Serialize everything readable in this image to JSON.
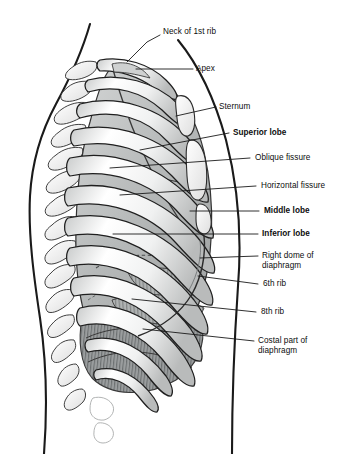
{
  "figure": {
    "background_color": "#ffffff",
    "outline_color": "#1a1a1a",
    "bone_color": "#f2f2f0",
    "lung_color": "#b9bcbd",
    "muscle_color": "#9a9c9d",
    "label_color": "#0d0d0d"
  },
  "labels": [
    {
      "id": "neck-of-1st-rib",
      "text": "Neck of 1st rib",
      "bold": false,
      "x": 163,
      "y": 27,
      "leader": [
        [
          160,
          35
        ],
        [
          147,
          42
        ],
        [
          127,
          62
        ]
      ]
    },
    {
      "id": "apex",
      "text": "Apex",
      "bold": false,
      "x": 196,
      "y": 64,
      "leader": [
        [
          193,
          69
        ],
        [
          136,
          69
        ]
      ]
    },
    {
      "id": "sternum",
      "text": "Sternum",
      "bold": false,
      "x": 219,
      "y": 102,
      "leader": [
        [
          216,
          107
        ],
        [
          176,
          116
        ]
      ]
    },
    {
      "id": "superior-lobe",
      "text": "Superior lobe",
      "bold": true,
      "x": 233,
      "y": 128,
      "leader": [
        [
          229,
          133
        ],
        [
          140,
          150
        ]
      ]
    },
    {
      "id": "oblique-fissure",
      "text": "Oblique fissure",
      "bold": false,
      "x": 255,
      "y": 153,
      "leader": [
        [
          250,
          158
        ],
        [
          110,
          168
        ]
      ]
    },
    {
      "id": "horizontal-fissure",
      "text": "Horizontal fissure",
      "bold": false,
      "x": 261,
      "y": 181,
      "leader": [
        [
          256,
          186
        ],
        [
          120,
          195
        ]
      ]
    },
    {
      "id": "middle-lobe",
      "text": "Middle lobe",
      "bold": true,
      "x": 264,
      "y": 206,
      "leader": [
        [
          259,
          211
        ],
        [
          190,
          211
        ]
      ]
    },
    {
      "id": "inferior-lobe",
      "text": "Inferior lobe",
      "bold": true,
      "x": 262,
      "y": 229,
      "leader": [
        [
          258,
          234
        ],
        [
          113,
          234
        ]
      ]
    },
    {
      "id": "right-dome-of-diaphragm",
      "text": "Right dome of\ndiaphragm",
      "bold": false,
      "x": 262,
      "y": 251,
      "leader": [
        [
          258,
          256
        ],
        [
          200,
          258
        ]
      ]
    },
    {
      "id": "6th-rib",
      "text": "6th rib",
      "bold": false,
      "x": 263,
      "y": 279,
      "leader": [
        [
          258,
          284
        ],
        [
          198,
          276
        ]
      ]
    },
    {
      "id": "8th-rib",
      "text": "8th rib",
      "bold": false,
      "x": 261,
      "y": 307,
      "leader": [
        [
          256,
          312
        ],
        [
          132,
          299
        ]
      ]
    },
    {
      "id": "costal-part-of-diaphragm",
      "text": "Costal part of\ndiaphragm",
      "bold": false,
      "x": 258,
      "y": 336,
      "leader": [
        [
          254,
          341
        ],
        [
          143,
          329
        ]
      ]
    }
  ]
}
